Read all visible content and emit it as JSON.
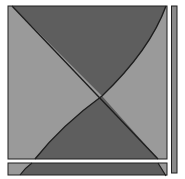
{
  "canvas": {
    "width": 185,
    "height": 179,
    "background": "#ffffff"
  },
  "colors": {
    "light_region": "#9a9a9a",
    "dark_region": "#5e5e5e",
    "outline": "#1e1e1e",
    "scrollbar_fill": "#8a8a8a"
  },
  "main_panel": {
    "label": "",
    "regions": [
      "left-light",
      "top-dark",
      "right-light",
      "bottom-dark"
    ]
  },
  "horizontal_bar": {
    "label": ""
  },
  "vertical_bar": {
    "label": ""
  }
}
